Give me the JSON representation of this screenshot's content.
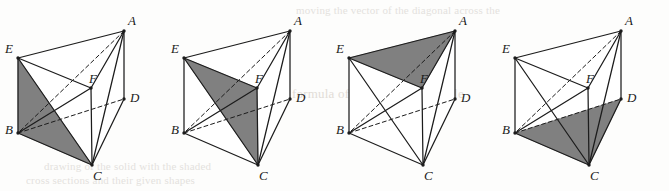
{
  "sheet": {
    "width": 669,
    "height": 191,
    "background_color": "#fdfdfc",
    "ghost_text": {
      "top_line": "moving the vector of the diagonal across the",
      "mid_line": "formula of the area of a triangle",
      "bottom_line_1": "drawing of the solid with the shaded",
      "bottom_line_2": "cross sections and their given shapes"
    }
  },
  "geometry": {
    "shape_name": "triangular prism",
    "stroke_color": "#1c1c1c",
    "shade_color": "#808080",
    "face_color": "#ffffff",
    "vertices": {
      "A": {
        "x": 124,
        "y": 31,
        "label": "A"
      },
      "E": {
        "x": 18,
        "y": 58,
        "label": "E"
      },
      "F": {
        "x": 91,
        "y": 88,
        "label": "F"
      },
      "B": {
        "x": 18,
        "y": 133,
        "label": "B"
      },
      "C": {
        "x": 92,
        "y": 165,
        "label": "C"
      },
      "D": {
        "x": 124,
        "y": 99,
        "label": "D"
      }
    },
    "edges": [
      {
        "from": "A",
        "to": "E",
        "style": "solid"
      },
      {
        "from": "E",
        "to": "F",
        "style": "solid"
      },
      {
        "from": "A",
        "to": "F",
        "style": "solid"
      },
      {
        "from": "B",
        "to": "C",
        "style": "solid"
      },
      {
        "from": "C",
        "to": "D",
        "style": "solid"
      },
      {
        "from": "B",
        "to": "D",
        "style": "dashed"
      },
      {
        "from": "A",
        "to": "D",
        "style": "solid"
      },
      {
        "from": "E",
        "to": "B",
        "style": "solid"
      },
      {
        "from": "F",
        "to": "C",
        "style": "solid"
      },
      {
        "from": "A",
        "to": "B",
        "style": "dashed"
      },
      {
        "from": "A",
        "to": "C",
        "style": "solid"
      },
      {
        "from": "E",
        "to": "C",
        "style": "solid"
      },
      {
        "from": "B",
        "to": "F",
        "style": "solid"
      }
    ]
  },
  "figures": [
    {
      "id": "figure-1",
      "index": 1,
      "offset_x": 0,
      "shaded_face": "EBC",
      "shaded_vertices": [
        "E",
        "B",
        "C"
      ],
      "caption": ""
    },
    {
      "id": "figure-2",
      "index": 2,
      "offset_x": 166,
      "shaded_face": "EFC",
      "shaded_vertices": [
        "E",
        "F",
        "C"
      ],
      "caption": ""
    },
    {
      "id": "figure-3",
      "index": 3,
      "offset_x": 331,
      "shaded_face": "AEF",
      "shaded_vertices": [
        "A",
        "E",
        "F"
      ],
      "caption": ""
    },
    {
      "id": "figure-4",
      "index": 4,
      "offset_x": 497,
      "shaded_face": "BCD",
      "shaded_vertices": [
        "B",
        "C",
        "D"
      ],
      "caption": ""
    }
  ],
  "labels": {
    "A": "A",
    "B": "B",
    "C": "C",
    "D": "D",
    "E": "E",
    "F": "F"
  }
}
